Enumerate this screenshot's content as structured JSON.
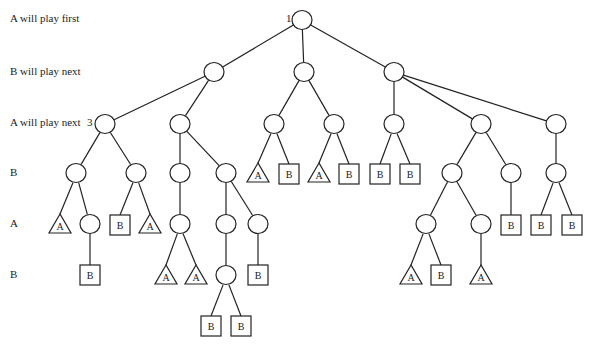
{
  "row_labels": [
    {
      "text": "A will play first",
      "y": 20
    },
    {
      "text": "B will play next",
      "y": 73
    },
    {
      "text": "A will play next",
      "y": 124
    },
    {
      "text": "B",
      "y": 174
    },
    {
      "text": "A",
      "y": 225
    },
    {
      "text": "B",
      "y": 276
    }
  ],
  "node_numbers": [
    {
      "text": "1",
      "x": 286,
      "y": 20
    },
    {
      "text": "3",
      "x": 87,
      "y": 124
    }
  ],
  "style": {
    "stroke": "#222222",
    "fill": "#ffffff"
  },
  "nodes": [
    {
      "id": "n0",
      "type": "circle",
      "x": 302,
      "y": 20
    },
    {
      "id": "n1",
      "type": "circle",
      "x": 214,
      "y": 72,
      "parent": "n0"
    },
    {
      "id": "n2",
      "type": "circle",
      "x": 304,
      "y": 72,
      "parent": "n0"
    },
    {
      "id": "n3",
      "type": "circle",
      "x": 394,
      "y": 72,
      "parent": "n0"
    },
    {
      "id": "n4",
      "type": "circle",
      "x": 105,
      "y": 124,
      "parent": "n1"
    },
    {
      "id": "n5",
      "type": "circle",
      "x": 180,
      "y": 124,
      "parent": "n1"
    },
    {
      "id": "n6",
      "type": "circle",
      "x": 274,
      "y": 124,
      "parent": "n2"
    },
    {
      "id": "n7",
      "type": "circle",
      "x": 334,
      "y": 124,
      "parent": "n2"
    },
    {
      "id": "n8",
      "type": "circle",
      "x": 394,
      "y": 124,
      "parent": "n3"
    },
    {
      "id": "n9",
      "type": "circle",
      "x": 481,
      "y": 124,
      "parent": "n3"
    },
    {
      "id": "n10",
      "type": "circle",
      "x": 556,
      "y": 124,
      "parent": "n3"
    },
    {
      "id": "n11",
      "type": "circle",
      "x": 76,
      "y": 173,
      "parent": "n4"
    },
    {
      "id": "n12",
      "type": "circle",
      "x": 136,
      "y": 173,
      "parent": "n4"
    },
    {
      "id": "n13",
      "type": "circle",
      "x": 180,
      "y": 173,
      "parent": "n5"
    },
    {
      "id": "n14",
      "type": "circle",
      "x": 226,
      "y": 173,
      "parent": "n5"
    },
    {
      "id": "n15",
      "type": "triangle",
      "label": "A",
      "x": 258,
      "y": 174,
      "parent": "n6"
    },
    {
      "id": "n16",
      "type": "square",
      "label": "B",
      "x": 289,
      "y": 174,
      "parent": "n6"
    },
    {
      "id": "n17",
      "type": "triangle",
      "label": "A",
      "x": 319,
      "y": 174,
      "parent": "n7"
    },
    {
      "id": "n18",
      "type": "square",
      "label": "B",
      "x": 349,
      "y": 174,
      "parent": "n7"
    },
    {
      "id": "n19",
      "type": "square",
      "label": "B",
      "x": 380,
      "y": 174,
      "parent": "n8"
    },
    {
      "id": "n20",
      "type": "square",
      "label": "B",
      "x": 410,
      "y": 174,
      "parent": "n8"
    },
    {
      "id": "n21",
      "type": "circle",
      "x": 452,
      "y": 173,
      "parent": "n9"
    },
    {
      "id": "n22",
      "type": "circle",
      "x": 511,
      "y": 173,
      "parent": "n9"
    },
    {
      "id": "n23",
      "type": "circle",
      "x": 556,
      "y": 173,
      "parent": "n10"
    },
    {
      "id": "n24",
      "type": "triangle",
      "label": "A",
      "x": 60,
      "y": 225,
      "parent": "n11"
    },
    {
      "id": "n25",
      "type": "circle",
      "x": 90,
      "y": 224,
      "parent": "n11"
    },
    {
      "id": "n26",
      "type": "square",
      "label": "B",
      "x": 120,
      "y": 225,
      "parent": "n12"
    },
    {
      "id": "n27",
      "type": "triangle",
      "label": "A",
      "x": 150,
      "y": 225,
      "parent": "n12"
    },
    {
      "id": "n28",
      "type": "circle",
      "x": 180,
      "y": 224,
      "parent": "n13"
    },
    {
      "id": "n29",
      "type": "circle",
      "x": 226,
      "y": 224,
      "parent": "n14"
    },
    {
      "id": "n30",
      "type": "circle",
      "x": 258,
      "y": 224,
      "parent": "n14"
    },
    {
      "id": "n31",
      "type": "circle",
      "x": 426,
      "y": 224,
      "parent": "n21"
    },
    {
      "id": "n32",
      "type": "circle",
      "x": 481,
      "y": 224,
      "parent": "n21"
    },
    {
      "id": "n33",
      "type": "square",
      "label": "B",
      "x": 511,
      "y": 225,
      "parent": "n22"
    },
    {
      "id": "n34",
      "type": "square",
      "label": "B",
      "x": 541,
      "y": 225,
      "parent": "n23"
    },
    {
      "id": "n35",
      "type": "square",
      "label": "B",
      "x": 572,
      "y": 225,
      "parent": "n23"
    },
    {
      "id": "n36",
      "type": "square",
      "label": "B",
      "x": 90,
      "y": 275,
      "parent": "n25"
    },
    {
      "id": "n37",
      "type": "triangle",
      "label": "A",
      "x": 166,
      "y": 276,
      "parent": "n28"
    },
    {
      "id": "n38",
      "type": "triangle",
      "label": "A",
      "x": 196,
      "y": 276,
      "parent": "n28"
    },
    {
      "id": "n39",
      "type": "circle",
      "x": 226,
      "y": 275,
      "parent": "n29"
    },
    {
      "id": "n40",
      "type": "square",
      "label": "B",
      "x": 258,
      "y": 275,
      "parent": "n30"
    },
    {
      "id": "n41",
      "type": "triangle",
      "label": "A",
      "x": 411,
      "y": 276,
      "parent": "n31"
    },
    {
      "id": "n42",
      "type": "square",
      "label": "B",
      "x": 441,
      "y": 275,
      "parent": "n31"
    },
    {
      "id": "n43",
      "type": "triangle",
      "label": "A",
      "x": 481,
      "y": 276,
      "parent": "n32"
    },
    {
      "id": "n44",
      "type": "square",
      "label": "B",
      "x": 211,
      "y": 326,
      "parent": "n39"
    },
    {
      "id": "n45",
      "type": "square",
      "label": "B",
      "x": 241,
      "y": 326,
      "parent": "n39"
    }
  ]
}
